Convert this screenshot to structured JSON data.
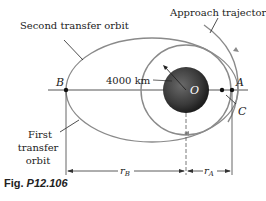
{
  "labels": {
    "second_transfer_orbit": "Second transfer orbit",
    "approach_trajectory": "Approach trajectory",
    "first_transfer_orbit_line1": "First",
    "first_transfer_orbit_line2": "transfer",
    "first_transfer_orbit_line3": "orbit",
    "radius": "4000 km",
    "point_b": "B",
    "point_a": "A",
    "point_c": "C",
    "point_o": "O",
    "dim_rb": "r",
    "dim_rb_sub": "B",
    "dim_ra": "r",
    "dim_ra_sub": "A"
  },
  "caption": {
    "prefix": "Fig. ",
    "id": "P12.106"
  },
  "colors": {
    "orbit": "#8a8a8a",
    "line": "#222222",
    "planet": "#3a3a3a"
  }
}
